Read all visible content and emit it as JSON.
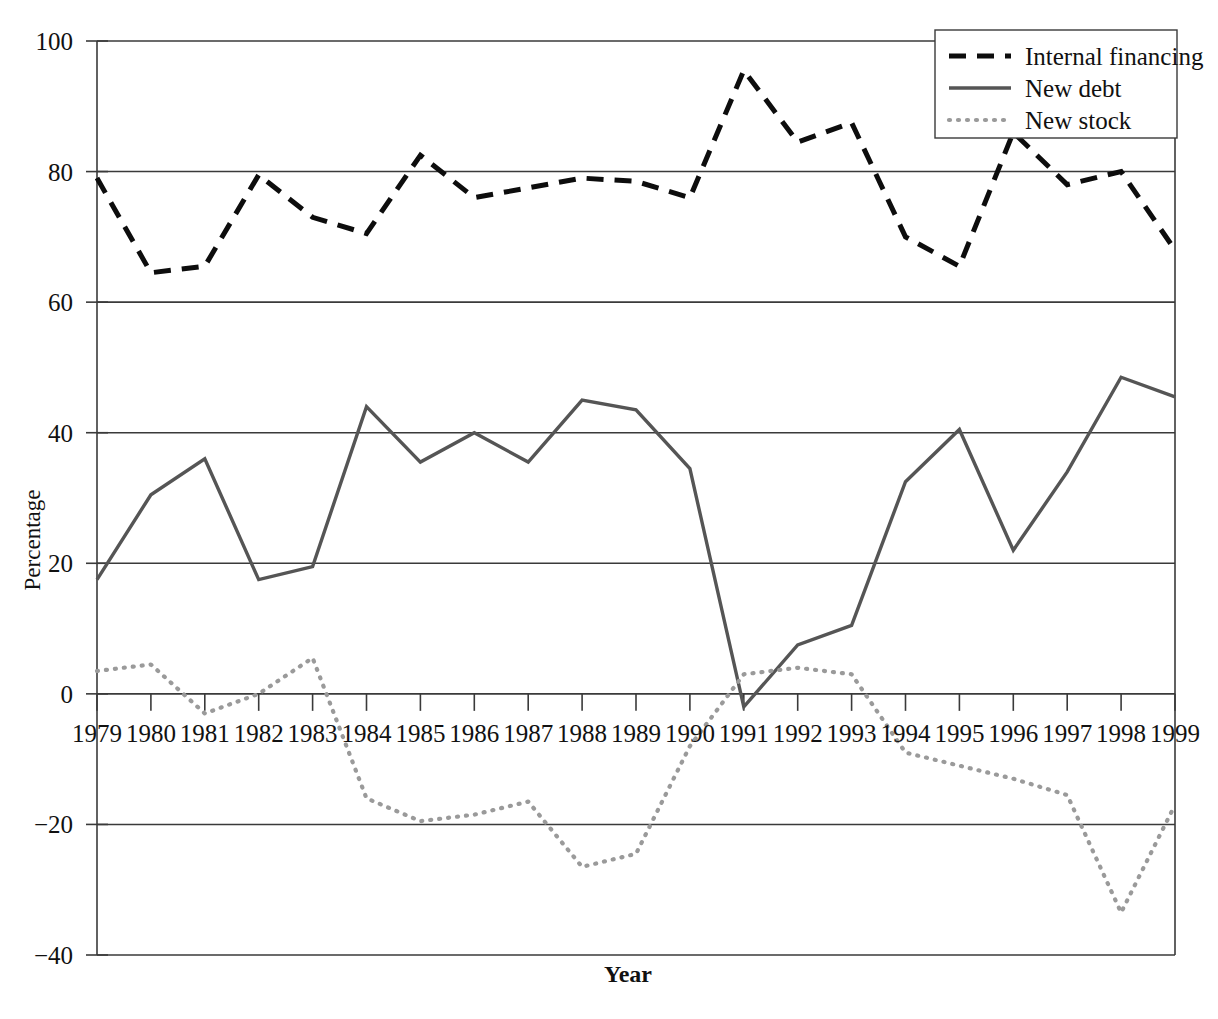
{
  "chart_data": {
    "type": "line",
    "title": "",
    "xlabel": "Year",
    "ylabel": "Percentage",
    "grid": true,
    "legend_position": "top-right",
    "xlim": [
      1979,
      1999
    ],
    "ylim": [
      -40,
      100
    ],
    "x": [
      1979,
      1980,
      1981,
      1982,
      1983,
      1984,
      1985,
      1986,
      1987,
      1988,
      1989,
      1990,
      1991,
      1992,
      1993,
      1994,
      1995,
      1996,
      1997,
      1998,
      1999
    ],
    "xticklabels": [
      "1979",
      "1980",
      "1981",
      "1982",
      "1983",
      "1984",
      "1985",
      "1986",
      "1987",
      "1988",
      "1989",
      "1990",
      "1991",
      "1992",
      "1993",
      "1994",
      "1995",
      "1996",
      "1997",
      "1998",
      "1999"
    ],
    "yticks": [
      100,
      80,
      60,
      40,
      20,
      0,
      -20,
      -40
    ],
    "yticklabels": [
      "100",
      "80",
      "60",
      "40",
      "20",
      "0",
      "−20",
      "−40"
    ],
    "series": [
      {
        "name": "Internal financing",
        "style": "dashed",
        "color": "#0d0d0d",
        "values": [
          79.0,
          64.5,
          65.5,
          79.5,
          73.0,
          70.5,
          82.5,
          76.0,
          77.5,
          79.0,
          78.5,
          76.0,
          95.5,
          84.5,
          87.5,
          70.0,
          65.5,
          86.0,
          78.0,
          80.0,
          68.0
        ]
      },
      {
        "name": "New debt",
        "style": "solid",
        "color": "#555555",
        "values": [
          17.5,
          30.5,
          36.0,
          17.5,
          19.5,
          44.0,
          35.5,
          40.0,
          35.5,
          45.0,
          43.5,
          34.5,
          -2.0,
          7.5,
          10.5,
          32.5,
          40.5,
          22.0,
          34.0,
          48.5,
          45.5
        ]
      },
      {
        "name": "New stock",
        "style": "dotted",
        "color": "#9a9a9a",
        "values": [
          3.5,
          4.5,
          -3.0,
          0.0,
          5.5,
          -16.0,
          -19.5,
          -18.5,
          -16.5,
          -26.5,
          -24.5,
          -8.0,
          3.0,
          4.0,
          3.0,
          -9.0,
          -11.0,
          -13.0,
          -15.5,
          -33.5,
          -17.0
        ]
      }
    ]
  },
  "legend": {
    "entries": [
      {
        "label": "Internal financing"
      },
      {
        "label": "New debt"
      },
      {
        "label": "New stock"
      }
    ]
  },
  "axes": {
    "x_title": "Year",
    "y_title": "Percentage"
  }
}
